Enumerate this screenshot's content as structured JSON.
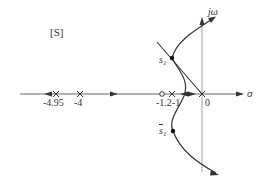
{
  "diagram": {
    "type": "root-locus",
    "plane_label": "[S]",
    "axes": {
      "real_label": "σ",
      "imag_label": "jω",
      "origin_label": "0"
    },
    "poles": [
      {
        "value": -4.95,
        "label": "-4.95"
      },
      {
        "value": -4,
        "label": "-4"
      },
      {
        "value": -1,
        "label": "-1"
      },
      {
        "value": 0,
        "label": ""
      }
    ],
    "zeros": [
      {
        "value": -1.2,
        "label": "-1.2"
      }
    ],
    "tick_label_combined": "-1.2-1",
    "points": [
      {
        "name": "s1",
        "label": "s",
        "subscript": "1"
      },
      {
        "name": "s1-conjugate",
        "label": "s",
        "subscript": "1",
        "overline": true
      }
    ],
    "colors": {
      "line": "#333333",
      "axis": "#888888",
      "background": "#ffffff"
    }
  }
}
